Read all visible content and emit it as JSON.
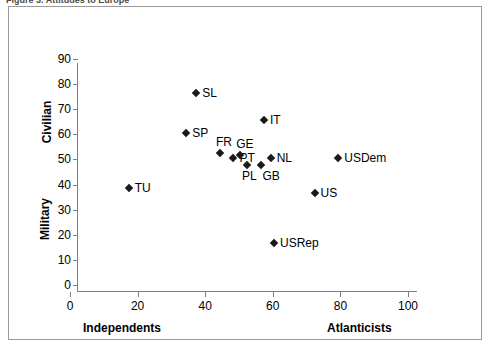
{
  "caption": {
    "text": "Figure 3.  Attitudes to Europe"
  },
  "chart_data": {
    "type": "scatter",
    "title": "",
    "xlabel": "",
    "ylabel": "",
    "xlim": [
      0,
      100
    ],
    "ylim": [
      0,
      90
    ],
    "grid": false,
    "legend": "none",
    "x_axis": {
      "label_left": "Independents",
      "label_right": "Atlanticists",
      "ticks": [
        0,
        20,
        40,
        60,
        80,
        100
      ],
      "tick_labels": [
        "0",
        "20",
        "40",
        "60",
        "80",
        "100"
      ]
    },
    "y_axis": {
      "label_top": "Civilian",
      "label_bottom": "Military",
      "ticks": [
        0,
        10,
        20,
        30,
        40,
        50,
        60,
        70,
        80,
        90
      ],
      "tick_labels": [
        "0",
        "10",
        "20",
        "30",
        "40",
        "50",
        "60",
        "70",
        "80",
        "90"
      ]
    },
    "marker_color": "#1a1a1a",
    "marker_shape": "diamond",
    "points": [
      {
        "label": "SL",
        "x": 35,
        "y": 79,
        "label_pos": "right"
      },
      {
        "label": "IT",
        "x": 55,
        "y": 68,
        "label_pos": "right"
      },
      {
        "label": "SP",
        "x": 32,
        "y": 63,
        "label_pos": "right"
      },
      {
        "label": "FR",
        "x": 42,
        "y": 55,
        "label_pos": "above"
      },
      {
        "label": "PT",
        "x": 46,
        "y": 53,
        "label_pos": "right"
      },
      {
        "label": "GE",
        "x": 48,
        "y": 54,
        "label_pos": "above"
      },
      {
        "label": "NL",
        "x": 57,
        "y": 53,
        "label_pos": "right"
      },
      {
        "label": "PL",
        "x": 50,
        "y": 50,
        "label_pos": "below"
      },
      {
        "label": "GB",
        "x": 54,
        "y": 50,
        "label_pos": "belowr"
      },
      {
        "label": "USDem",
        "x": 77,
        "y": 53,
        "label_pos": "right"
      },
      {
        "label": "US",
        "x": 70,
        "y": 39,
        "label_pos": "right"
      },
      {
        "label": "TU",
        "x": 15,
        "y": 41,
        "label_pos": "right"
      },
      {
        "label": "USRep",
        "x": 58,
        "y": 19,
        "label_pos": "right"
      }
    ]
  }
}
